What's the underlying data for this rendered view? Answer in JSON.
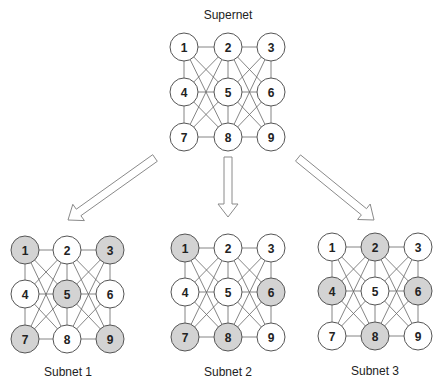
{
  "colors": {
    "node_stroke": "#555555",
    "node_fill": "#ffffff",
    "selected_fill": "#d3d3d3",
    "edge": "#666666",
    "arrow_stroke": "#8a8a8a",
    "text": "#222222"
  },
  "node_radius": 14,
  "networks": [
    {
      "id": "supernet",
      "title": "Supernet",
      "title_pos": [
        228,
        19
      ],
      "cols_x": [
        184,
        228,
        271
      ],
      "rows_y": [
        47,
        92,
        137
      ],
      "selected": []
    },
    {
      "id": "subnet-1",
      "title": "Subnet 1",
      "title_pos": [
        68,
        376
      ],
      "cols_x": [
        25,
        67,
        110
      ],
      "rows_y": [
        250,
        294,
        339
      ],
      "selected": [
        1,
        3,
        5,
        7,
        9
      ]
    },
    {
      "id": "subnet-2",
      "title": "Subnet 2",
      "title_pos": [
        228,
        376
      ],
      "cols_x": [
        185,
        228,
        271
      ],
      "rows_y": [
        248,
        292,
        337
      ],
      "selected": [
        1,
        6,
        7,
        8
      ]
    },
    {
      "id": "subnet-3",
      "title": "Subnet 3",
      "title_pos": [
        375,
        375
      ],
      "cols_x": [
        332,
        375,
        418
      ],
      "rows_y": [
        247,
        291,
        336
      ],
      "selected": [
        2,
        4,
        6,
        8
      ]
    }
  ],
  "arrows": [
    {
      "name": "arrow-to-subnet-1",
      "from": [
        155,
        158
      ],
      "to": [
        68,
        220
      ]
    },
    {
      "name": "arrow-to-subnet-2",
      "from": [
        228,
        157
      ],
      "to": [
        228,
        217
      ]
    },
    {
      "name": "arrow-to-subnet-3",
      "from": [
        298,
        158
      ],
      "to": [
        374,
        220
      ]
    }
  ]
}
